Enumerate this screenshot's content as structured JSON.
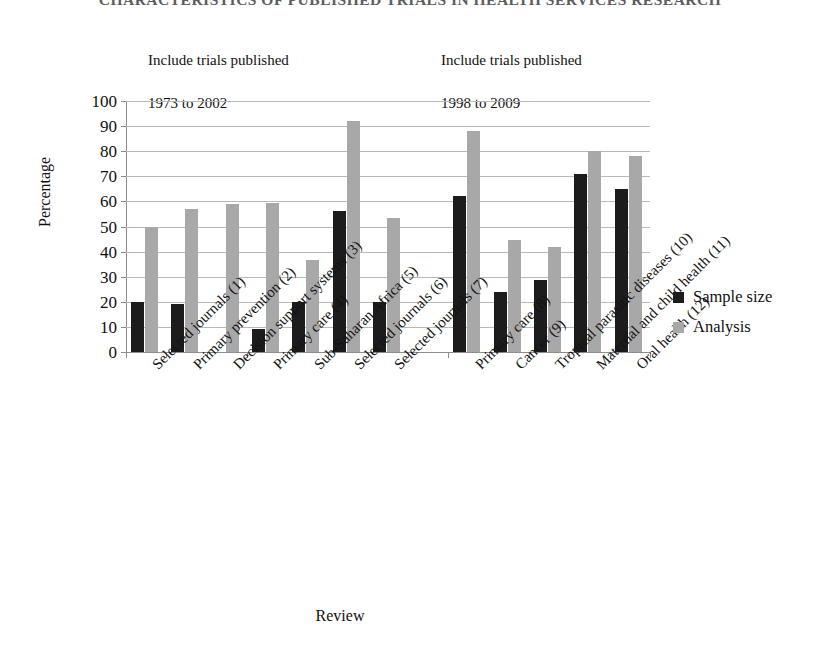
{
  "running_head": "CHARACTERISTICS OF PUBLISHED TRIALS IN HEALTH SERVICES RESEARCH",
  "annotations": [
    {
      "id": "left",
      "line1": "Include trials published",
      "line2": "1973 to 2002"
    },
    {
      "id": "right",
      "line1": "Include trials published",
      "line2": "1998 to 2009"
    }
  ],
  "legend": {
    "position": "right",
    "entries": [
      {
        "label": "Sample size",
        "color": "#1c1c1c"
      },
      {
        "label": "Analysis",
        "color": "#a8a8a8"
      }
    ]
  },
  "chart_data": {
    "type": "bar",
    "title": "",
    "xlabel": "Review",
    "ylabel": "Percentage",
    "ylim": [
      0,
      100
    ],
    "ytick_step": 10,
    "yticks": [
      100,
      90,
      80,
      70,
      60,
      50,
      40,
      30,
      20,
      10,
      0
    ],
    "grid": true,
    "grid_axis": "y",
    "categories": [
      "Selected journals (1)",
      "Primary prevention (2)",
      "Decision support systems (3)",
      "Primary care (4)",
      "Sub-Saharan Africa (5)",
      "Selected journals (6)",
      "Selected journals (7)",
      "",
      "Primary care (8)",
      "Cancer (9)",
      "Tropical parasitic diseases (10)",
      "Maternal and child health (11)",
      "Oral health (12)"
    ],
    "series": [
      {
        "name": "Sample size",
        "color": "#1c1c1c",
        "values": [
          20,
          19,
          null,
          9,
          20,
          56,
          20,
          null,
          62,
          24,
          28.5,
          71,
          65
        ]
      },
      {
        "name": "Analysis",
        "color": "#a8a8a8",
        "values": [
          50,
          57,
          59,
          59.5,
          36.5,
          92,
          53.5,
          null,
          88,
          44.5,
          42,
          80,
          78
        ]
      }
    ]
  }
}
